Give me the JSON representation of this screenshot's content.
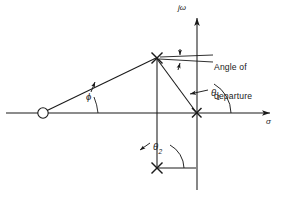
{
  "figure": {
    "kind": "root-locus-pole-zero-plot",
    "background_color": "#ffffff",
    "stroke_color": "#1a1a1a",
    "width": 292,
    "height": 198
  },
  "axes": {
    "real": {
      "name": "sigma-axis",
      "label": "σ",
      "y": 113,
      "x_start": 6,
      "x_end": 276,
      "arrow": "right"
    },
    "imaginary": {
      "name": "j-omega-axis",
      "label": "jω",
      "x": 197,
      "y_top": 12,
      "y_bottom": 190,
      "arrow": "up"
    }
  },
  "markers": {
    "zero": {
      "name": "open-loop-zero",
      "glyph": "o",
      "x": 43,
      "y": 113,
      "radius": 5.2
    },
    "poles": [
      {
        "name": "complex-pole-upper",
        "glyph": "x",
        "x": 157,
        "y": 58
      },
      {
        "name": "complex-pole-lower",
        "glyph": "x",
        "x": 157,
        "y": 168
      },
      {
        "name": "real-pole-origin",
        "glyph": "x",
        "x": 197,
        "y": 113
      }
    ]
  },
  "angles": {
    "phi": {
      "label": "ϕ",
      "sub": "",
      "x": 88,
      "y": 95,
      "vertex_x": 43,
      "vertex_y": 113
    },
    "theta1": {
      "label": "θ",
      "sub": "1",
      "x": 211,
      "y": 92,
      "vertex_x": 197,
      "vertex_y": 113
    },
    "theta2": {
      "label": "θ",
      "sub": "2",
      "x": 152,
      "y": 146,
      "vertex_x": 157,
      "vertex_y": 168
    }
  },
  "annotation": {
    "name": "angle-of-departure-callout",
    "line1": "Angle of",
    "line2": "departure",
    "x": 215,
    "y": 50
  }
}
